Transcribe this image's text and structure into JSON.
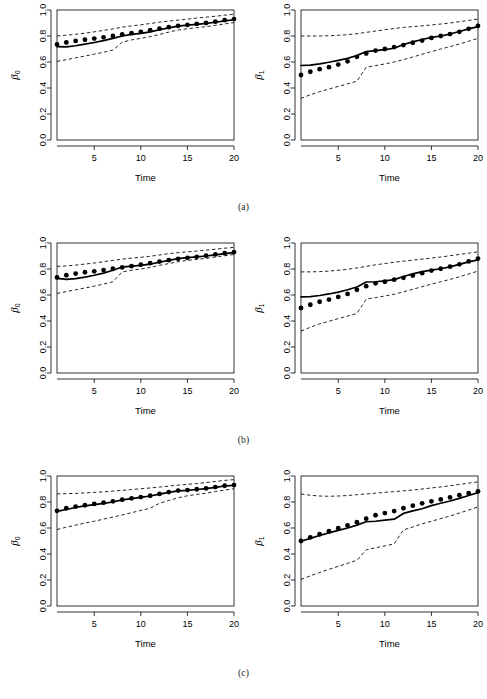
{
  "figure": {
    "panel_width": 243,
    "panel_height": 205,
    "rows": [
      {
        "caption": "(a)"
      },
      {
        "caption": "(b)"
      },
      {
        "caption": "(c)"
      }
    ]
  },
  "axes": {
    "x_label": "Time",
    "x_ticks": [
      5,
      10,
      15,
      20
    ],
    "x_tick_labels": [
      "5",
      "10",
      "15",
      "20"
    ],
    "x_range": [
      1,
      20
    ],
    "y_ticks": [
      0.0,
      0.2,
      0.4,
      0.6,
      0.8,
      1.0
    ],
    "y_tick_labels": [
      "0.0",
      "0.2",
      "0.4",
      "0.6",
      "0.8",
      "1.0"
    ],
    "y_range": [
      0.0,
      1.0
    ],
    "y_label_beta0_symbol": "β",
    "y_label_beta0_subscript": "0",
    "y_label_beta1_symbol": "β",
    "y_label_beta1_subscript": "1"
  },
  "chart_data": [
    {
      "type": "line",
      "panel_id": "a-beta0",
      "row": "(a)",
      "column": "left",
      "title": "",
      "xlabel": "Time",
      "ylabel": "β₀",
      "xlim": [
        1,
        20
      ],
      "ylim": [
        0.0,
        1.0
      ],
      "grid": false,
      "legend": "none",
      "x": [
        1,
        2,
        3,
        4,
        5,
        6,
        7,
        8,
        9,
        10,
        11,
        12,
        13,
        14,
        15,
        16,
        17,
        18,
        19,
        20
      ],
      "series": [
        {
          "name": "true-values-points",
          "style": "points",
          "values": [
            0.735,
            0.75,
            0.762,
            0.772,
            0.78,
            0.79,
            0.8,
            0.812,
            0.822,
            0.832,
            0.845,
            0.856,
            0.868,
            0.878,
            0.885,
            0.893,
            0.9,
            0.91,
            0.922,
            0.93
          ]
        },
        {
          "name": "estimate",
          "style": "solid-line",
          "values": [
            0.718,
            0.716,
            0.725,
            0.737,
            0.75,
            0.765,
            0.782,
            0.8,
            0.812,
            0.82,
            0.832,
            0.848,
            0.862,
            0.876,
            0.884,
            0.89,
            0.897,
            0.906,
            0.916,
            0.925
          ]
        },
        {
          "name": "upper-confidence-band",
          "style": "dashed-line",
          "values": [
            0.8,
            0.806,
            0.813,
            0.822,
            0.832,
            0.843,
            0.855,
            0.868,
            0.878,
            0.886,
            0.896,
            0.906,
            0.915,
            0.922,
            0.93,
            0.938,
            0.945,
            0.952,
            0.96,
            0.968
          ]
        },
        {
          "name": "lower-confidence-band",
          "style": "dashed-line",
          "values": [
            0.605,
            0.618,
            0.632,
            0.646,
            0.66,
            0.675,
            0.692,
            0.752,
            0.77,
            0.782,
            0.795,
            0.812,
            0.83,
            0.846,
            0.856,
            0.864,
            0.872,
            0.882,
            0.893,
            0.903
          ]
        }
      ]
    },
    {
      "type": "line",
      "panel_id": "a-beta1",
      "row": "(a)",
      "column": "right",
      "title": "",
      "xlabel": "Time",
      "ylabel": "β₁",
      "xlim": [
        1,
        20
      ],
      "ylim": [
        0.0,
        1.0
      ],
      "grid": false,
      "legend": "none",
      "x": [
        1,
        2,
        3,
        4,
        5,
        6,
        7,
        8,
        9,
        10,
        11,
        12,
        13,
        14,
        15,
        16,
        17,
        18,
        19,
        20
      ],
      "series": [
        {
          "name": "true-values-points",
          "style": "points",
          "values": [
            0.5,
            0.525,
            0.545,
            0.56,
            0.58,
            0.605,
            0.64,
            0.665,
            0.688,
            0.7,
            0.715,
            0.73,
            0.748,
            0.765,
            0.785,
            0.8,
            0.815,
            0.832,
            0.855,
            0.878
          ]
        },
        {
          "name": "estimate",
          "style": "solid-line",
          "values": [
            0.573,
            0.576,
            0.585,
            0.598,
            0.612,
            0.628,
            0.65,
            0.68,
            0.688,
            0.695,
            0.706,
            0.735,
            0.755,
            0.773,
            0.79,
            0.8,
            0.815,
            0.835,
            0.855,
            0.872
          ]
        },
        {
          "name": "upper-confidence-band",
          "style": "dashed-line",
          "values": [
            0.8,
            0.8,
            0.8,
            0.802,
            0.805,
            0.81,
            0.818,
            0.828,
            0.838,
            0.848,
            0.858,
            0.866,
            0.872,
            0.878,
            0.885,
            0.892,
            0.9,
            0.91,
            0.92,
            0.93
          ]
        },
        {
          "name": "lower-confidence-band",
          "style": "dashed-line",
          "values": [
            0.32,
            0.348,
            0.372,
            0.392,
            0.412,
            0.432,
            0.452,
            0.56,
            0.572,
            0.585,
            0.6,
            0.618,
            0.638,
            0.66,
            0.68,
            0.7,
            0.718,
            0.738,
            0.76,
            0.782
          ]
        }
      ]
    },
    {
      "type": "line",
      "panel_id": "b-beta0",
      "row": "(b)",
      "column": "left",
      "title": "",
      "xlabel": "Time",
      "ylabel": "β₀",
      "xlim": [
        1,
        20
      ],
      "ylim": [
        0.0,
        1.0
      ],
      "grid": false,
      "legend": "none",
      "x": [
        1,
        2,
        3,
        4,
        5,
        6,
        7,
        8,
        9,
        10,
        11,
        12,
        13,
        14,
        15,
        16,
        17,
        18,
        19,
        20
      ],
      "series": [
        {
          "name": "true-values-points",
          "style": "points",
          "values": [
            0.735,
            0.752,
            0.765,
            0.775,
            0.782,
            0.792,
            0.802,
            0.812,
            0.822,
            0.833,
            0.845,
            0.857,
            0.868,
            0.878,
            0.886,
            0.894,
            0.902,
            0.912,
            0.922,
            0.93
          ]
        },
        {
          "name": "estimate",
          "style": "solid-line",
          "values": [
            0.728,
            0.72,
            0.726,
            0.738,
            0.752,
            0.768,
            0.79,
            0.815,
            0.822,
            0.828,
            0.838,
            0.852,
            0.866,
            0.88,
            0.888,
            0.893,
            0.9,
            0.908,
            0.918,
            0.926
          ]
        },
        {
          "name": "upper-confidence-band",
          "style": "dashed-line",
          "values": [
            0.82,
            0.824,
            0.83,
            0.838,
            0.846,
            0.856,
            0.866,
            0.876,
            0.884,
            0.89,
            0.898,
            0.908,
            0.918,
            0.926,
            0.932,
            0.938,
            0.945,
            0.952,
            0.96,
            0.966
          ]
        },
        {
          "name": "lower-confidence-band",
          "style": "dashed-line",
          "values": [
            0.612,
            0.626,
            0.64,
            0.654,
            0.668,
            0.684,
            0.702,
            0.778,
            0.79,
            0.8,
            0.812,
            0.828,
            0.842,
            0.856,
            0.866,
            0.874,
            0.882,
            0.892,
            0.902,
            0.912
          ]
        }
      ]
    },
    {
      "type": "line",
      "panel_id": "b-beta1",
      "row": "(b)",
      "column": "right",
      "title": "",
      "xlabel": "Time",
      "ylabel": "β₁",
      "xlim": [
        1,
        20
      ],
      "ylim": [
        0.0,
        1.0
      ],
      "grid": false,
      "legend": "none",
      "x": [
        1,
        2,
        3,
        4,
        5,
        6,
        7,
        8,
        9,
        10,
        11,
        12,
        13,
        14,
        15,
        16,
        17,
        18,
        19,
        20
      ],
      "series": [
        {
          "name": "true-values-points",
          "style": "points",
          "values": [
            0.5,
            0.525,
            0.548,
            0.565,
            0.585,
            0.608,
            0.64,
            0.668,
            0.69,
            0.702,
            0.718,
            0.732,
            0.75,
            0.768,
            0.788,
            0.802,
            0.818,
            0.836,
            0.858,
            0.88
          ]
        },
        {
          "name": "estimate",
          "style": "solid-line",
          "values": [
            0.585,
            0.588,
            0.596,
            0.608,
            0.622,
            0.64,
            0.662,
            0.7,
            0.702,
            0.708,
            0.718,
            0.742,
            0.762,
            0.78,
            0.792,
            0.802,
            0.816,
            0.836,
            0.855,
            0.87
          ]
        },
        {
          "name": "upper-confidence-band",
          "style": "dashed-line",
          "values": [
            0.778,
            0.778,
            0.78,
            0.784,
            0.79,
            0.798,
            0.808,
            0.82,
            0.832,
            0.842,
            0.852,
            0.86,
            0.868,
            0.876,
            0.884,
            0.892,
            0.902,
            0.912,
            0.922,
            0.932
          ]
        },
        {
          "name": "lower-confidence-band",
          "style": "dashed-line",
          "values": [
            0.322,
            0.352,
            0.378,
            0.398,
            0.418,
            0.438,
            0.458,
            0.568,
            0.58,
            0.592,
            0.606,
            0.624,
            0.644,
            0.664,
            0.684,
            0.702,
            0.72,
            0.74,
            0.762,
            0.784
          ]
        }
      ]
    },
    {
      "type": "line",
      "panel_id": "c-beta0",
      "row": "(c)",
      "column": "left",
      "title": "",
      "xlabel": "Time",
      "ylabel": "β₀",
      "xlim": [
        1,
        20
      ],
      "ylim": [
        0.0,
        1.0
      ],
      "grid": false,
      "legend": "none",
      "x": [
        1,
        2,
        3,
        4,
        5,
        6,
        7,
        8,
        9,
        10,
        11,
        12,
        13,
        14,
        15,
        16,
        17,
        18,
        19,
        20
      ],
      "series": [
        {
          "name": "true-values-points",
          "style": "points",
          "values": [
            0.732,
            0.752,
            0.765,
            0.775,
            0.785,
            0.795,
            0.805,
            0.818,
            0.828,
            0.838,
            0.848,
            0.862,
            0.876,
            0.888,
            0.892,
            0.898,
            0.905,
            0.915,
            0.925,
            0.93
          ]
        },
        {
          "name": "estimate",
          "style": "solid-line",
          "values": [
            0.728,
            0.742,
            0.758,
            0.77,
            0.78,
            0.79,
            0.8,
            0.816,
            0.826,
            0.836,
            0.846,
            0.86,
            0.874,
            0.886,
            0.89,
            0.896,
            0.903,
            0.913,
            0.923,
            0.928
          ]
        },
        {
          "name": "upper-confidence-band",
          "style": "dashed-line",
          "values": [
            0.862,
            0.864,
            0.866,
            0.87,
            0.874,
            0.878,
            0.884,
            0.89,
            0.896,
            0.902,
            0.908,
            0.915,
            0.922,
            0.93,
            0.936,
            0.942,
            0.95,
            0.958,
            0.966,
            0.972
          ]
        },
        {
          "name": "lower-confidence-band",
          "style": "dashed-line",
          "values": [
            0.588,
            0.606,
            0.622,
            0.638,
            0.652,
            0.668,
            0.684,
            0.7,
            0.718,
            0.735,
            0.752,
            0.79,
            0.812,
            0.832,
            0.848,
            0.858,
            0.868,
            0.88,
            0.892,
            0.902
          ]
        }
      ]
    },
    {
      "type": "line",
      "panel_id": "c-beta1",
      "row": "(c)",
      "column": "right",
      "title": "",
      "xlabel": "Time",
      "ylabel": "β₁",
      "xlim": [
        1,
        20
      ],
      "ylim": [
        0.0,
        1.0
      ],
      "grid": false,
      "legend": "none",
      "x": [
        1,
        2,
        3,
        4,
        5,
        6,
        7,
        8,
        9,
        10,
        11,
        12,
        13,
        14,
        15,
        16,
        17,
        18,
        19,
        20
      ],
      "series": [
        {
          "name": "true-values-points",
          "style": "points",
          "values": [
            0.5,
            0.528,
            0.552,
            0.575,
            0.598,
            0.62,
            0.645,
            0.672,
            0.698,
            0.715,
            0.73,
            0.752,
            0.772,
            0.79,
            0.805,
            0.82,
            0.835,
            0.852,
            0.868,
            0.882
          ]
        },
        {
          "name": "estimate",
          "style": "solid-line",
          "values": [
            0.498,
            0.52,
            0.542,
            0.562,
            0.582,
            0.6,
            0.622,
            0.648,
            0.652,
            0.66,
            0.668,
            0.712,
            0.732,
            0.748,
            0.772,
            0.79,
            0.808,
            0.828,
            0.85,
            0.872
          ]
        },
        {
          "name": "upper-confidence-band",
          "style": "dashed-line",
          "values": [
            0.862,
            0.852,
            0.846,
            0.844,
            0.846,
            0.85,
            0.856,
            0.862,
            0.868,
            0.874,
            0.88,
            0.886,
            0.892,
            0.9,
            0.908,
            0.916,
            0.925,
            0.935,
            0.945,
            0.955
          ]
        },
        {
          "name": "lower-confidence-band",
          "style": "dashed-line",
          "values": [
            0.205,
            0.232,
            0.258,
            0.282,
            0.305,
            0.328,
            0.352,
            0.432,
            0.448,
            0.462,
            0.478,
            0.585,
            0.608,
            0.632,
            0.652,
            0.672,
            0.692,
            0.715,
            0.738,
            0.762
          ]
        }
      ]
    }
  ]
}
